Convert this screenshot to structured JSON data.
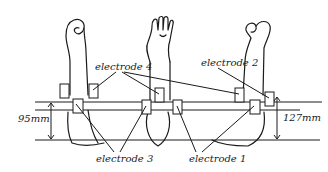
{
  "figure": {
    "type": "electrode placement diagram",
    "subjects": [
      "left arm (fist, side view)",
      "center arm (open hand, front view)",
      "right arm (fist, side view)"
    ]
  },
  "labels": {
    "electrode_1": "electrode 1",
    "electrode_2": "electrode 2",
    "electrode_3": "electrode 3",
    "electrode_4": "electrode 4"
  },
  "dimensions": {
    "left": "95mm",
    "right": "127mm"
  },
  "colors": {
    "line": "#1a1a1a",
    "background": "#ffffff"
  }
}
